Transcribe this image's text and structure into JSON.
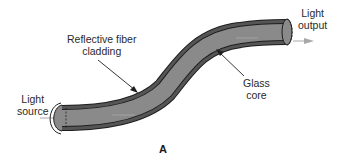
{
  "diagram": {
    "figure_label": "A",
    "labels": {
      "light_output_line1": "Light",
      "light_output_line2": "output",
      "cladding_line1": "Reflective fiber",
      "cladding_line2": "cladding",
      "core_line1": "Glass",
      "core_line2": "core",
      "source_line1": "Light",
      "source_line2": "source"
    },
    "colors": {
      "cladding": "#4a4a4a",
      "core": "#8a8a8a",
      "outline": "#1e1e1e",
      "arrow": "#a8a8a8",
      "text": "#2a2a2a"
    }
  }
}
